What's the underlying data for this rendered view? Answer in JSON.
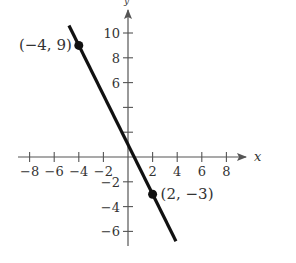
{
  "chart_data": {
    "type": "line",
    "title": "",
    "xlabel": "x",
    "ylabel": "y",
    "xlim": [
      -9,
      10
    ],
    "ylim": [
      -7,
      12
    ],
    "grid": false,
    "x_ticks": [
      -8,
      -6,
      -4,
      -2,
      2,
      4,
      6,
      8
    ],
    "x_tick_labels": [
      "−8",
      "−6",
      "−4",
      "−2",
      "2",
      "4",
      "6",
      "8"
    ],
    "y_ticks": [
      10,
      8,
      6,
      4,
      2,
      -2,
      -4,
      -6
    ],
    "y_tick_labels": [
      "10",
      "8",
      "6",
      "",
      "",
      "−2",
      "−4",
      "−6"
    ],
    "series": [
      {
        "name": "line",
        "x": [
          -4,
          2
        ],
        "y": [
          9,
          -3
        ],
        "slope": -2,
        "y_intercept": 1,
        "extent_x": [
          -4.8,
          3.9
        ]
      }
    ],
    "points": [
      {
        "x": -4,
        "y": 9,
        "label": "(−4, 9)"
      },
      {
        "x": 2,
        "y": -3,
        "label": "(2, −3)"
      }
    ],
    "colors": {
      "line": "#111111",
      "axis": "#555555",
      "text": "#333333"
    }
  }
}
